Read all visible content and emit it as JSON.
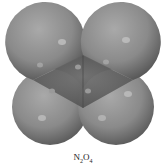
{
  "diagram": {
    "type": "space-filling molecular model",
    "molecule": "N2O4",
    "atoms": [
      {
        "element": "O",
        "position": "top-left"
      },
      {
        "element": "O",
        "position": "top-right"
      },
      {
        "element": "O",
        "position": "bottom-left"
      },
      {
        "element": "O",
        "position": "bottom-right"
      },
      {
        "element": "N",
        "position": "center-left"
      },
      {
        "element": "N",
        "position": "center-right"
      }
    ],
    "colors": {
      "oxygen": "#8c8c8c",
      "nitrogen": "#5e5e5e",
      "highlight": "#c9c9c9",
      "shadow": "#3e3e3e"
    }
  },
  "caption": {
    "base1": "N",
    "sub1": "2",
    "base2": "O",
    "sub2": "4"
  }
}
